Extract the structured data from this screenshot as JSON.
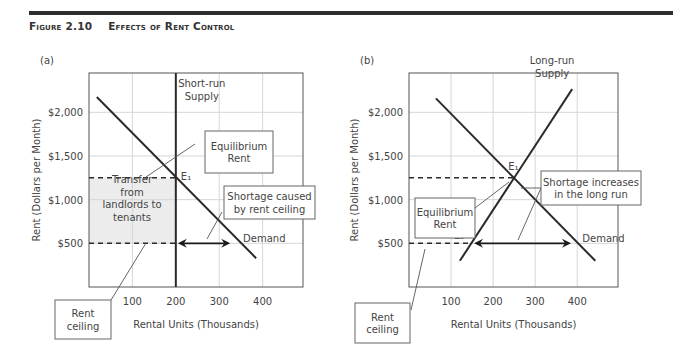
{
  "figure": {
    "number": "Figure 2.10",
    "title": "Effects of Rent Control"
  },
  "chart_data": [
    {
      "type": "line",
      "panel_label": "(a)",
      "title": "",
      "xlabel": "Rental Units (Thousands)",
      "ylabel": "Rent (Dollars per Month)",
      "xlim": [
        0,
        493
      ],
      "ylim": [
        0,
        2450
      ],
      "x_ticks": [
        100,
        200,
        300,
        400
      ],
      "x_tick_labels": [
        "100",
        "200",
        "300",
        "400"
      ],
      "y_ticks": [
        500,
        1000,
        1500,
        2000
      ],
      "y_tick_labels": [
        "$500",
        "$1,000",
        "$1,500",
        "$2,000"
      ],
      "grid": true,
      "series": [
        {
          "name": "Demand",
          "label": "Demand",
          "x": [
            18,
            385
          ],
          "y": [
            2175,
            330
          ]
        },
        {
          "name": "Short-run Supply",
          "label": "Short-run\nSupply",
          "x": [
            200,
            200
          ],
          "y": [
            0,
            2450
          ]
        }
      ],
      "equilibrium": {
        "label": "E₁",
        "x": 200,
        "y": 1250
      },
      "equilibrium_rent_dashed": 1250,
      "rent_ceiling": 500,
      "shortage_arrow": {
        "from": 200,
        "to": 330,
        "y": 500
      },
      "shaded_region": {
        "x": [
          0,
          200
        ],
        "y": [
          500,
          1250
        ]
      },
      "annotations": [
        {
          "id": "equilibrium-rent",
          "text": "Equilibrium\nRent"
        },
        {
          "id": "transfer",
          "text": "Transfer\nfrom\nlandlords to\ntenants"
        },
        {
          "id": "shortage",
          "text": "Shortage caused\nby rent ceiling"
        },
        {
          "id": "rent-ceiling",
          "text": "Rent\nceiling"
        }
      ]
    },
    {
      "type": "line",
      "panel_label": "(b)",
      "title": "",
      "xlabel": "Rental Units (Thousands)",
      "ylabel": "Rent (Dollars per Month)",
      "xlim": [
        0,
        497
      ],
      "ylim": [
        0,
        2450
      ],
      "x_ticks": [
        100,
        200,
        300,
        400
      ],
      "x_tick_labels": [
        "100",
        "200",
        "300",
        "400"
      ],
      "y_ticks": [
        500,
        1000,
        1500,
        2000
      ],
      "y_tick_labels": [
        "$500",
        "$1,000",
        "$1,500",
        "$2,000"
      ],
      "grid": true,
      "series": [
        {
          "name": "Demand",
          "label": "Demand",
          "x": [
            64,
            443
          ],
          "y": [
            2160,
            300
          ]
        },
        {
          "name": "Long-run Supply",
          "label": "Long-run\nSupply",
          "x": [
            121,
            388
          ],
          "y": [
            300,
            2265
          ]
        }
      ],
      "equilibrium": {
        "label": "E₁",
        "x": 250,
        "y": 1250
      },
      "ceiling_point": {
        "label": "E₂",
        "x": 150,
        "y": 500
      },
      "equilibrium_rent_dashed": 1250,
      "rent_ceiling": 500,
      "shortage_arrow": {
        "from": 150,
        "to": 390,
        "y": 500
      },
      "annotations": [
        {
          "id": "equilibrium-rent",
          "text": "Equilibrium\nRent"
        },
        {
          "id": "shortage",
          "text": "Shortage increases\nin the long run"
        },
        {
          "id": "rent-ceiling",
          "text": "Rent\nceiling"
        }
      ]
    }
  ]
}
